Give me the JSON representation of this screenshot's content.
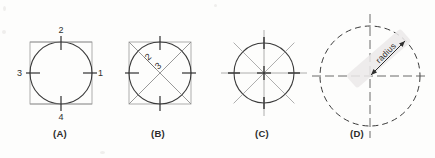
{
  "figure": {
    "background_color": "#fdfdfc",
    "ink_color": "#2f2f2f",
    "light_ink_color": "#8d8d8d",
    "highlight_color": "#eceaea",
    "panels": [
      {
        "id": "A",
        "caption": "(A)",
        "caption_x": 60,
        "caption_y": 134,
        "description": "circle inscribed in square with four numbered quadrant points",
        "center": {
          "x": 61,
          "y": 73
        },
        "radius": 31,
        "square": {
          "x": 30,
          "y": 42,
          "width": 62,
          "height": 62
        },
        "point_labels": [
          {
            "text": "1",
            "x": 98,
            "y": 76,
            "position": "right"
          },
          {
            "text": "2",
            "x": 61,
            "y": 33,
            "position": "top"
          },
          {
            "text": "3",
            "x": 22,
            "y": 76,
            "position": "left"
          },
          {
            "text": "4",
            "x": 61,
            "y": 120,
            "position": "bottom"
          }
        ]
      },
      {
        "id": "B",
        "caption": "(B)",
        "caption_x": 158,
        "caption_y": 134,
        "description": "circle in square with both diagonals drawn and two labels on upper-left diagonal",
        "center": {
          "x": 160,
          "y": 73
        },
        "radius": 31,
        "square": {
          "x": 129,
          "y": 42,
          "width": 62,
          "height": 62
        },
        "point_labels": [
          {
            "text": "2",
            "x": 152,
            "y": 58,
            "position": "diagonal-upper"
          },
          {
            "text": "3",
            "x": 161,
            "y": 66,
            "position": "diagonal-lower"
          }
        ]
      },
      {
        "id": "C",
        "caption": "(C)",
        "caption_x": 262,
        "caption_y": 134,
        "description": "circle with eight radial spokes extending beyond the circumference",
        "center": {
          "x": 264,
          "y": 73
        },
        "radius": 30,
        "spoke_outer": 43,
        "spoke_count": 8,
        "point_labels": []
      },
      {
        "id": "D",
        "caption": "(D)",
        "caption_x": 357,
        "caption_y": 134,
        "description": "dashed circle with center crosshairs and a radius dimension line with double arrowheads",
        "center": {
          "x": 370,
          "y": 76
        },
        "radius": 50,
        "dimension": {
          "label": "radius",
          "angle_degrees": -45,
          "arrow_both_ends": true
        },
        "point_labels": []
      }
    ]
  }
}
